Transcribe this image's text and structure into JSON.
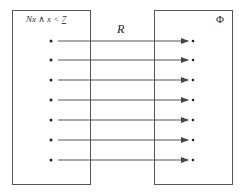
{
  "diagram": {
    "domain_set": {
      "label_main": "Nx ∧ x < ",
      "label_underlined": "7",
      "element_count": 7
    },
    "codomain_set": {
      "label": "Φ",
      "element_count": 7
    },
    "relation": {
      "label": "R",
      "mappings": [
        {
          "from": 1,
          "to": 1
        },
        {
          "from": 2,
          "to": 2
        },
        {
          "from": 3,
          "to": 3
        },
        {
          "from": 4,
          "to": 4
        },
        {
          "from": 5,
          "to": 5
        },
        {
          "from": 6,
          "to": 6
        },
        {
          "from": 7,
          "to": 7
        }
      ]
    },
    "colors": {
      "stroke": "#555555",
      "dot": "#222222",
      "background": "#ffffff"
    }
  }
}
